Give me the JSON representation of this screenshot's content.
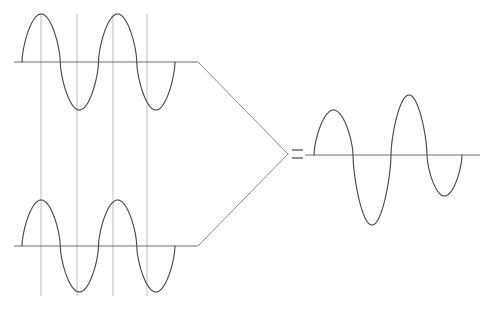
{
  "figure": {
    "title": "Waveform superposition diagram",
    "background_color": "#ffffff",
    "width": 496,
    "height": 311,
    "operator_symbol": "=",
    "colors": {
      "curve_stroke": "#4b4b50",
      "axis_stroke": "#6e6e74",
      "guide_stroke": "#b9b9bd",
      "arrow_stroke": "#8a8a90",
      "equals_stroke": "#55555b"
    }
  },
  "chart_data": {
    "type": "line",
    "title": "Waveform superposition diagram",
    "xlabel": "",
    "ylabel": "",
    "grid": false,
    "legend": "none",
    "panels": [
      {
        "name": "input-wave-top",
        "label": "Top input sine wave",
        "waveform": "sine",
        "baseline_y": 62,
        "x_start": 14,
        "x_end": 197,
        "wave_x_start": 22,
        "wave_x_end": 175,
        "cycles": 2,
        "amplitude": 48,
        "peak_y": 14,
        "trough_y": 110,
        "peaks_x": [
          41,
          113
        ],
        "troughs_x": [
          77,
          147
        ],
        "zero_crossings_x": [
          22,
          59,
          95,
          131,
          167
        ],
        "phase_deg": 0
      },
      {
        "name": "input-wave-bottom",
        "label": "Bottom input sine wave",
        "waveform": "sine",
        "baseline_y": 246,
        "x_start": 14,
        "x_end": 197,
        "wave_x_start": 22,
        "wave_x_end": 175,
        "cycles": 2,
        "amplitude": 46,
        "peak_y": 200,
        "trough_y": 292,
        "peaks_x": [
          41,
          113
        ],
        "troughs_x": [
          77,
          147
        ],
        "zero_crossings_x": [
          22,
          59,
          95,
          131,
          167
        ],
        "phase_deg": 0
      },
      {
        "name": "output-wave",
        "label": "Resulting modulated wave",
        "waveform": "amplitude-modulated-sine",
        "baseline_y": 155,
        "x_start": 305,
        "x_end": 480,
        "wave_x_start": 314,
        "wave_x_end": 462,
        "cycles": 2,
        "extrema": [
          {
            "kind": "peak",
            "x": 333,
            "y": 110,
            "amplitude": 45
          },
          {
            "kind": "trough",
            "x": 372,
            "y": 225,
            "amplitude": 70
          },
          {
            "kind": "peak",
            "x": 409,
            "y": 95,
            "amplitude": 60
          },
          {
            "kind": "trough",
            "x": 443,
            "y": 196,
            "amplitude": 41
          }
        ],
        "zero_crossings_x": [
          314,
          353,
          391,
          427,
          462
        ]
      }
    ],
    "guide_lines": [
      {
        "name": "alignment-guide-1",
        "x": 41,
        "y_top": 14,
        "y_bottom": 296
      },
      {
        "name": "alignment-guide-2",
        "x": 77,
        "y_top": 14,
        "y_bottom": 296
      },
      {
        "name": "alignment-guide-3",
        "x": 113,
        "y_top": 14,
        "y_bottom": 296
      },
      {
        "name": "alignment-guide-4",
        "x": 147,
        "y_top": 14,
        "y_bottom": 296
      }
    ],
    "connector": {
      "name": "combining-arrow",
      "apex_x": 288,
      "apex_y": 154,
      "upper_start": {
        "x": 198,
        "y": 62
      },
      "lower_start": {
        "x": 198,
        "y": 246
      }
    },
    "equals_sign": {
      "x_start": 292,
      "x_end": 303,
      "y_upper": 150,
      "y_lower": 158
    }
  }
}
